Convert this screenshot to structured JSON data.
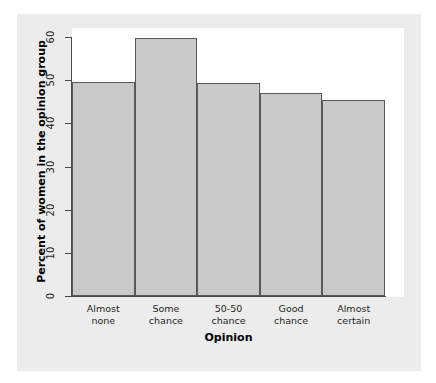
{
  "chart_data": {
    "type": "bar",
    "title": "",
    "subtitle": "",
    "xlabel": "Opinion",
    "ylabel": "Percent of women in the opinion group",
    "categories": [
      "Almost none",
      "Some chance",
      "50-50 chance",
      "Good chance",
      "Almost certain"
    ],
    "category_lines": [
      [
        "Almost",
        "none"
      ],
      [
        "Some",
        "chance"
      ],
      [
        "50-50",
        "chance"
      ],
      [
        "Good",
        "chance"
      ],
      [
        "Almost",
        "certain"
      ]
    ],
    "values": [
      49.5,
      59.7,
      49.4,
      47.0,
      45.4
    ],
    "ylim": [
      0,
      60
    ],
    "yticks": [
      0,
      10,
      20,
      30,
      40,
      50,
      60
    ],
    "ytick_labels": [
      "0",
      "10",
      "20",
      "30",
      "40",
      "50",
      "60"
    ],
    "grid": false,
    "legend": null,
    "bar_fill": "#c9c9c9",
    "bar_border": "#595959",
    "panel_background": "#ffffff",
    "card_background": "#ececec",
    "axis_color": "#4a4a4a"
  }
}
